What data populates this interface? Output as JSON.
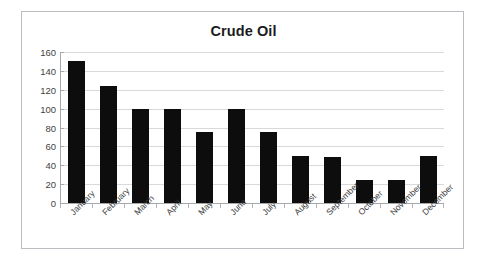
{
  "chart_data": {
    "type": "bar",
    "title": "Crude Oil",
    "xlabel": "",
    "ylabel": "",
    "categories": [
      "January",
      "February",
      "March",
      "April",
      "May",
      "June",
      "July",
      "August",
      "September",
      "October",
      "November",
      "December"
    ],
    "values": [
      150,
      124,
      100,
      100,
      75,
      100,
      75,
      50,
      49,
      24,
      24,
      50
    ],
    "ylim": [
      0,
      160
    ],
    "yticks": [
      0,
      20,
      40,
      60,
      80,
      100,
      120,
      140,
      160
    ],
    "ytick_labels": [
      "0",
      "20",
      "40",
      "60",
      "80",
      "100",
      "120",
      "140",
      "160"
    ],
    "grid": true,
    "legend": false,
    "series": [
      {
        "name": "Crude Oil",
        "values": [
          150,
          124,
          100,
          100,
          75,
          100,
          75,
          50,
          49,
          24,
          24,
          50
        ]
      }
    ],
    "colors": {
      "bar": "#0d0d0d",
      "gridline": "#d7d9dc",
      "axis": "#a6a8ab",
      "text": "#3f3f3f",
      "title": "#1c1c1c",
      "frame_border": "#b9bcc0",
      "background": "#ffffff"
    }
  }
}
